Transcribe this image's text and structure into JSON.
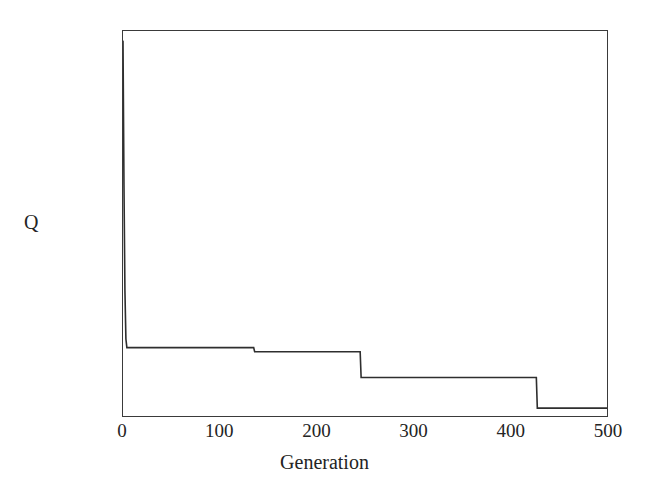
{
  "chart_data": {
    "type": "line",
    "title": "",
    "xlabel": "Generation",
    "ylabel": "Q",
    "xlim": [
      0,
      500
    ],
    "ylim": [
      0.054,
      0.058
    ],
    "grid": false,
    "legend": null,
    "x_ticks": [
      0,
      100,
      200,
      300,
      400,
      500
    ],
    "x_tick_labels": [
      "0",
      "100",
      "200",
      "300",
      "400",
      "500"
    ],
    "y_ticks": [
      0.054,
      0.0545,
      0.055,
      0.0555,
      0.056,
      0.0565,
      0.057,
      0.0575,
      0.058
    ],
    "y_tick_labels": [
      "0.054",
      "0.0545",
      "0.055",
      "0.0555",
      "0.056",
      "0.0565",
      "0.057",
      "0.0575",
      "0.058"
    ],
    "series": [
      {
        "name": "Q",
        "color": "#2e2e2e",
        "line_width": 1.6,
        "x": [
          0,
          1,
          2,
          3,
          4,
          135,
          136,
          245,
          246,
          427,
          428,
          500
        ],
        "y": [
          0.0579,
          0.0564,
          0.0553,
          0.0548,
          0.05471,
          0.05471,
          0.054668,
          0.054668,
          0.0544,
          0.0544,
          0.054082,
          0.054082
        ]
      }
    ],
    "annotations": [],
    "description_points": {
      "start_value": 0.0579,
      "plateau_1": 0.05471,
      "plateau_2": 0.054668,
      "plateau_3": 0.0544,
      "plateau_4": 0.054082,
      "step_generations": [
        135,
        245,
        427
      ]
    }
  },
  "axes": {
    "y_title": "Q",
    "x_title": "Generation"
  }
}
